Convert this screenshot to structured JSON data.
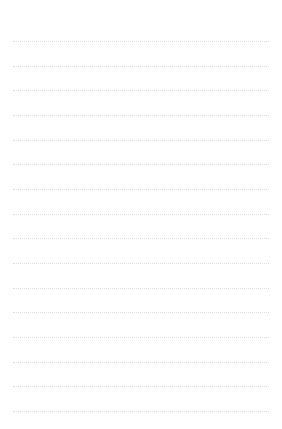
{
  "page": {
    "kind": "lined-paper",
    "title": "",
    "width": 282,
    "height": 429,
    "background_color": "#ffffff"
  },
  "ruling": {
    "style": "dotted",
    "line_color": "#dcdcdc",
    "line_thickness": 1,
    "line_count": 16,
    "first_line_y": 41,
    "line_spacing": 24.7,
    "left_margin": 13,
    "right_margin": 13,
    "line_start_x": 13,
    "line_end_x": 269,
    "line_width": 256,
    "lines": [
      {
        "index": 1,
        "y": 41,
        "content": ""
      },
      {
        "index": 2,
        "y": 66,
        "content": ""
      },
      {
        "index": 3,
        "y": 90,
        "content": ""
      },
      {
        "index": 4,
        "y": 115,
        "content": ""
      },
      {
        "index": 5,
        "y": 140,
        "content": ""
      },
      {
        "index": 6,
        "y": 164,
        "content": ""
      },
      {
        "index": 7,
        "y": 189,
        "content": ""
      },
      {
        "index": 8,
        "y": 214,
        "content": ""
      },
      {
        "index": 9,
        "y": 238,
        "content": ""
      },
      {
        "index": 10,
        "y": 263,
        "content": ""
      },
      {
        "index": 11,
        "y": 288,
        "content": ""
      },
      {
        "index": 12,
        "y": 312,
        "content": ""
      },
      {
        "index": 13,
        "y": 337,
        "content": ""
      },
      {
        "index": 14,
        "y": 362,
        "content": ""
      },
      {
        "index": 15,
        "y": 386,
        "content": ""
      },
      {
        "index": 16,
        "y": 411,
        "content": ""
      }
    ]
  },
  "margins": {
    "top_blank_height": 41,
    "bottom_blank_height": 18,
    "vertical_margin_rule": false,
    "header_text": "",
    "footer_text": ""
  }
}
